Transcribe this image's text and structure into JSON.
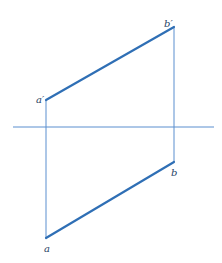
{
  "diagram": {
    "type": "orthographic-projection-line-segment",
    "colors": {
      "thick_line": "#2f6fb5",
      "thin_line": "#5b8fcf",
      "label": "#1f3f66"
    },
    "projection_axis": {
      "x1": 13,
      "y1": 127,
      "x2": 214,
      "y2": 127
    },
    "points": {
      "a_prime": {
        "label": "a′",
        "x": 46,
        "y": 100
      },
      "b_prime": {
        "label": "b′",
        "x": 174,
        "y": 27
      },
      "b": {
        "label": "b",
        "x": 174,
        "y": 162
      },
      "a": {
        "label": "a",
        "x": 46,
        "y": 238
      }
    },
    "labels": {
      "a_prime": "a′",
      "b_prime": "b′",
      "b": "b",
      "a": "a"
    }
  }
}
